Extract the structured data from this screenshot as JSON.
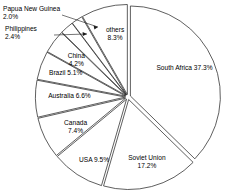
{
  "chart_data": {
    "type": "pie",
    "title": "",
    "subtitle": "",
    "xlabel": "",
    "ylabel": "",
    "legend_position": "none",
    "grid": false,
    "units": "%",
    "start_angle_deg": 0,
    "direction": "clockwise",
    "total": 100.0,
    "categories": [
      "South Africa",
      "Soviet Union",
      "USA",
      "Canada",
      "Australia",
      "Brazil",
      "China",
      "Philippines",
      "Papua New Guinea",
      "others"
    ],
    "values": [
      37.3,
      17.2,
      9.5,
      7.4,
      6.6,
      5.1,
      4.2,
      2.4,
      2.0,
      8.3
    ],
    "slices": [
      {
        "name": "South Africa",
        "value": 37.3,
        "label": "South Africa 37.3%",
        "label_line1": "South Africa 37.3%",
        "label_line2": "",
        "label_placement": "inside",
        "exploded": true
      },
      {
        "name": "Soviet Union",
        "value": 17.2,
        "label": "Soviet Union 17.2%",
        "label_line1": "Soviet Union",
        "label_line2": "17.2%",
        "label_placement": "inside",
        "exploded": true
      },
      {
        "name": "USA",
        "value": 9.5,
        "label": "USA 9.5%",
        "label_line1": "USA 9.5%",
        "label_line2": "",
        "label_placement": "inside",
        "exploded": true
      },
      {
        "name": "Canada",
        "value": 7.4,
        "label": "Canada 7.4%",
        "label_line1": "Canada",
        "label_line2": "7.4%",
        "label_placement": "inside",
        "exploded": true
      },
      {
        "name": "Australia",
        "value": 6.6,
        "label": "Australia 6.6%",
        "label_line1": "Australia 6.6%",
        "label_line2": "",
        "label_placement": "inside",
        "exploded": true
      },
      {
        "name": "Brazil",
        "value": 5.1,
        "label": "Brazil 5.1%",
        "label_line1": "Brazil 5.1%",
        "label_line2": "",
        "label_placement": "inside",
        "exploded": true
      },
      {
        "name": "China",
        "value": 4.2,
        "label": "China 4.2%",
        "label_line1": "China",
        "label_line2": "4.2%",
        "label_placement": "inside",
        "exploded": true
      },
      {
        "name": "Philippines",
        "value": 2.4,
        "label": "Philippines 2.4%",
        "label_line1": "Philippines",
        "label_line2": "2.4%",
        "label_placement": "outside-leader",
        "exploded": true
      },
      {
        "name": "Papua New Guinea",
        "value": 2.0,
        "label": "Papua New Guinea 2.0%",
        "label_line1": "Papua New Guinea",
        "label_line2": "2.0%",
        "label_placement": "outside-leader",
        "exploded": true
      },
      {
        "name": "others",
        "value": 8.3,
        "label": "others 8.3%",
        "label_line1": "others",
        "label_line2": "8.3%",
        "label_placement": "inside",
        "exploded": true
      }
    ],
    "colors": {
      "slice_fill": "#ffffff",
      "slice_stroke": "#1a1a1a",
      "text": "#000000",
      "background": "#ffffff"
    }
  }
}
